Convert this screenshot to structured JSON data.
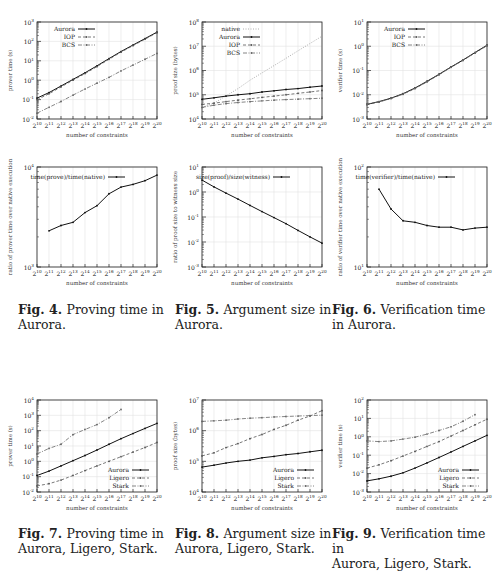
{
  "x_ticks": [
    "2^10",
    "2^11",
    "2^12",
    "2^13",
    "2^14",
    "2^15",
    "2^16",
    "2^17",
    "2^18",
    "2^19",
    "2^20"
  ],
  "figures": [
    {
      "id": "fig4",
      "label": "Fig. 4.",
      "text_line1": "Proving time in",
      "text_line2": "Aurora."
    },
    {
      "id": "fig5",
      "label": "Fig. 5.",
      "text_line1": "Argument size in",
      "text_line2": "Aurora."
    },
    {
      "id": "fig6",
      "label": "Fig. 6.",
      "text_line1": "Verification time",
      "text_line2": "in Aurora."
    },
    {
      "id": "fig7",
      "label": "Fig. 7.",
      "text_line1": "Proving time in",
      "text_line2": "Aurora, Ligero, Stark."
    },
    {
      "id": "fig8",
      "label": "Fig. 8.",
      "text_line1": "Argument size in",
      "text_line2": "Aurora, Ligero, Stark."
    },
    {
      "id": "fig9",
      "label": "Fig. 9.",
      "text_line1": "Verification time in",
      "text_line2": "Aurora, Ligero, Stark."
    }
  ],
  "chart_data": [
    {
      "id": "c1",
      "type": "line",
      "title": "",
      "xlabel": "number of constraints",
      "ylabel": "prover time (s)",
      "ylog": [
        -2,
        3
      ],
      "yticks": [
        "10^-2",
        "10^-1",
        "10^0",
        "10^1",
        "10^2",
        "10^3"
      ],
      "legend_position": "top-left",
      "grid": true,
      "categories": [
        "2^10",
        "2^11",
        "2^12",
        "2^13",
        "2^14",
        "2^15",
        "2^16",
        "2^17",
        "2^18",
        "2^19",
        "2^20"
      ],
      "series": [
        {
          "name": "Aurora",
          "style": "solid",
          "values": [
            0.12,
            0.23,
            0.5,
            1.1,
            2.4,
            5.5,
            13,
            30,
            65,
            140,
            300
          ]
        },
        {
          "name": "IOP",
          "style": "dashed",
          "values": [
            0.1,
            0.2,
            0.45,
            1.0,
            2.2,
            5.0,
            12,
            28,
            60,
            130,
            280
          ]
        },
        {
          "name": "BCS",
          "style": "dotdash",
          "values": [
            0.02,
            0.04,
            0.08,
            0.17,
            0.35,
            0.7,
            1.4,
            3.0,
            6.0,
            12,
            24
          ]
        }
      ]
    },
    {
      "id": "c2",
      "type": "line",
      "title": "",
      "xlabel": "number of constraints",
      "ylabel": "proof size (bytes)",
      "ylog": [
        4,
        8
      ],
      "yticks": [
        "10^4",
        "10^5",
        "10^6",
        "10^7",
        "10^8"
      ],
      "legend_position": "top-left",
      "grid": true,
      "categories": [
        "2^10",
        "2^11",
        "2^12",
        "2^13",
        "2^14",
        "2^15",
        "2^16",
        "2^17",
        "2^18",
        "2^19",
        "2^20"
      ],
      "series": [
        {
          "name": "native",
          "style": "dotted",
          "values": [
            30000,
            45000,
            90000,
            180000,
            400000,
            800000,
            1600000,
            3200000,
            6500000,
            13000000,
            26000000
          ]
        },
        {
          "name": "Aurora",
          "style": "solid",
          "values": [
            65000,
            75000,
            88000,
            100000,
            110000,
            130000,
            145000,
            165000,
            180000,
            205000,
            230000
          ]
        },
        {
          "name": "IOP",
          "style": "dashed",
          "values": [
            40000,
            45000,
            52000,
            60000,
            68000,
            78000,
            88000,
            100000,
            115000,
            130000,
            150000
          ]
        },
        {
          "name": "BCS",
          "style": "dotdash",
          "values": [
            30000,
            37000,
            43000,
            48000,
            52000,
            56000,
            60000,
            63000,
            66000,
            69000,
            72000
          ]
        }
      ]
    },
    {
      "id": "c3",
      "type": "line",
      "title": "",
      "xlabel": "number of constraints",
      "ylabel": "verifier time (s)",
      "ylog": [
        -3,
        1
      ],
      "yticks": [
        "10^-3",
        "10^-2",
        "10^-1",
        "10^0",
        "10^1"
      ],
      "legend_position": "top-left",
      "grid": true,
      "categories": [
        "2^10",
        "2^11",
        "2^12",
        "2^13",
        "2^14",
        "2^15",
        "2^16",
        "2^17",
        "2^18",
        "2^19",
        "2^20"
      ],
      "series": [
        {
          "name": "Aurora",
          "style": "solid",
          "values": [
            0.004,
            0.0052,
            0.0072,
            0.011,
            0.019,
            0.036,
            0.07,
            0.14,
            0.27,
            0.55,
            1.1
          ]
        },
        {
          "name": "IOP",
          "style": "dashed",
          "values": [
            0.004,
            0.005,
            0.007,
            0.0105,
            0.018,
            0.034,
            0.067,
            0.135,
            0.26,
            0.53,
            1.05
          ]
        },
        {
          "name": "BCS",
          "style": "dotdash",
          "values": [
            0.0041,
            0.0051,
            0.0071,
            0.0107,
            0.0185,
            0.035,
            0.068,
            0.137,
            0.265,
            0.54,
            1.07
          ]
        }
      ]
    },
    {
      "id": "c4",
      "type": "line",
      "title": "",
      "xlabel": "number of constraints",
      "ylabel": "ratio of prover time over native execution",
      "ylog": [
        3,
        4
      ],
      "yticks": [
        "10^3",
        "10^4"
      ],
      "legend_position": "top-center",
      "grid": true,
      "categories": [
        "2^10",
        "2^11",
        "2^12",
        "2^13",
        "2^14",
        "2^15",
        "2^16",
        "2^17",
        "2^18",
        "2^19",
        "2^20"
      ],
      "series": [
        {
          "name": "time(prove)/time(native)",
          "style": "solid",
          "values": [
            null,
            2300,
            2600,
            2800,
            3500,
            4100,
            5400,
            6300,
            6700,
            7300,
            8300
          ]
        }
      ]
    },
    {
      "id": "c5",
      "type": "line",
      "title": "",
      "xlabel": "number of constraints",
      "ylabel": "ratio of proof size to witness size",
      "ylog": [
        -3,
        1
      ],
      "yticks": [
        "10^-3",
        "10^-2",
        "10^-1",
        "10^0",
        "10^1"
      ],
      "legend_position": "top-center",
      "grid": true,
      "categories": [
        "2^10",
        "2^11",
        "2^12",
        "2^13",
        "2^14",
        "2^15",
        "2^16",
        "2^17",
        "2^18",
        "2^19",
        "2^20"
      ],
      "series": [
        {
          "name": "size(proof)/size(witness)",
          "style": "solid",
          "values": [
            3.0,
            1.6,
            0.9,
            0.52,
            0.29,
            0.165,
            0.095,
            0.054,
            0.029,
            0.016,
            0.009
          ]
        }
      ]
    },
    {
      "id": "c6",
      "type": "line",
      "title": "",
      "xlabel": "number of constraints",
      "ylabel": "ratio of verifier time over native execution",
      "ylog": [
        1,
        2
      ],
      "yticks": [
        "10^1",
        "10^2"
      ],
      "legend_position": "top-center",
      "grid": true,
      "categories": [
        "2^10",
        "2^11",
        "2^12",
        "2^13",
        "2^14",
        "2^15",
        "2^16",
        "2^17",
        "2^18",
        "2^19",
        "2^20"
      ],
      "series": [
        {
          "name": "time(verifier)/time(native)",
          "style": "solid",
          "values": [
            null,
            60,
            38,
            29,
            28,
            26,
            25,
            25,
            23.5,
            24.5,
            25
          ]
        }
      ]
    },
    {
      "id": "c7",
      "type": "line",
      "title": "",
      "xlabel": "number of constraints",
      "ylabel": "prover time (s)",
      "ylog": [
        -2,
        4
      ],
      "yticks": [
        "10^-2",
        "10^-1",
        "10^0",
        "10^1",
        "10^2",
        "10^3",
        "10^4"
      ],
      "legend_position": "bottom-right",
      "grid": true,
      "categories": [
        "2^10",
        "2^11",
        "2^12",
        "2^13",
        "2^14",
        "2^15",
        "2^16",
        "2^17",
        "2^18",
        "2^19",
        "2^20"
      ],
      "series": [
        {
          "name": "Aurora",
          "style": "solid",
          "values": [
            0.12,
            0.23,
            0.5,
            1.1,
            2.4,
            5.5,
            13,
            30,
            65,
            140,
            300
          ]
        },
        {
          "name": "Ligero",
          "style": "dashed",
          "values": [
            0.025,
            0.035,
            0.06,
            0.12,
            0.25,
            0.5,
            1.0,
            2.0,
            4.0,
            8.0,
            17
          ]
        },
        {
          "name": "Stark",
          "style": "dotdash",
          "values": [
            3.0,
            7.0,
            13,
            55,
            120,
            250,
            700,
            2400,
            null,
            null,
            null
          ]
        }
      ]
    },
    {
      "id": "c8",
      "type": "line",
      "title": "",
      "xlabel": "number of constraints",
      "ylabel": "proof size (bytes)",
      "ylog": [
        4,
        7
      ],
      "yticks": [
        "10^4",
        "10^5",
        "10^6",
        "10^7"
      ],
      "legend_position": "bottom-right",
      "grid": true,
      "categories": [
        "2^10",
        "2^11",
        "2^12",
        "2^13",
        "2^14",
        "2^15",
        "2^16",
        "2^17",
        "2^18",
        "2^19",
        "2^20"
      ],
      "series": [
        {
          "name": "Aurora",
          "style": "solid",
          "values": [
            65000,
            75000,
            88000,
            100000,
            110000,
            130000,
            145000,
            165000,
            180000,
            205000,
            230000
          ]
        },
        {
          "name": "Ligero",
          "style": "dashed",
          "values": [
            150000,
            190000,
            280000,
            380000,
            550000,
            750000,
            1100000,
            1500000,
            2200000,
            3000000,
            4500000
          ]
        },
        {
          "name": "Stark",
          "style": "dotdash",
          "values": [
            2000000,
            2100000,
            2200000,
            2400000,
            2550000,
            2650000,
            2800000,
            2900000,
            3000000,
            3100000,
            3200000
          ]
        }
      ]
    },
    {
      "id": "c9",
      "type": "line",
      "title": "",
      "xlabel": "number of constraints",
      "ylabel": "verifier time (s)",
      "ylog": [
        -3,
        2
      ],
      "yticks": [
        "10^-3",
        "10^-2",
        "10^-1",
        "10^0",
        "10^1",
        "10^2"
      ],
      "legend_position": "bottom-right",
      "grid": true,
      "categories": [
        "2^10",
        "2^11",
        "2^12",
        "2^13",
        "2^14",
        "2^15",
        "2^16",
        "2^17",
        "2^18",
        "2^19",
        "2^20"
      ],
      "series": [
        {
          "name": "Aurora",
          "style": "solid",
          "values": [
            0.004,
            0.0052,
            0.0072,
            0.011,
            0.02,
            0.038,
            0.075,
            0.15,
            0.3,
            0.6,
            1.2
          ]
        },
        {
          "name": "Ligero",
          "style": "dashed",
          "values": [
            0.02,
            0.03,
            0.05,
            0.09,
            0.16,
            0.3,
            0.55,
            1.1,
            2.2,
            4.5,
            9
          ]
        },
        {
          "name": "Stark",
          "style": "dotdash",
          "values": [
            0.6,
            0.55,
            0.6,
            0.75,
            0.95,
            1.4,
            2.2,
            3.5,
            7,
            16,
            null
          ]
        }
      ]
    }
  ]
}
